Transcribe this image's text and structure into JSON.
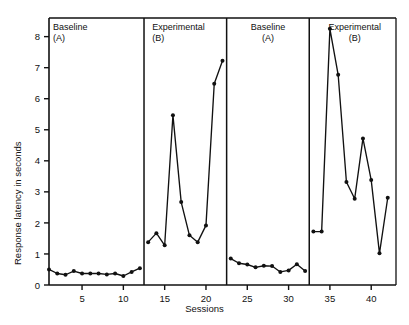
{
  "chart_data": {
    "type": "line",
    "title": "",
    "xlabel": "Sessions",
    "ylabel": "Response latency in seconds",
    "xlim": [
      1,
      43
    ],
    "ylim": [
      0,
      8.6
    ],
    "xticks": [
      5,
      10,
      15,
      20,
      25,
      30,
      35,
      40
    ],
    "yticks": [
      0,
      1,
      2,
      3,
      4,
      5,
      6,
      7,
      8
    ],
    "grid": false,
    "legend": "none",
    "phases": [
      {
        "name": "Baseline",
        "condition": "(A)",
        "x_start": 1,
        "x_end": 12,
        "align": "left"
      },
      {
        "name": "Experimental",
        "condition": "(B)",
        "x_start": 13,
        "x_end": 22,
        "align": "left"
      },
      {
        "name": "Baseline",
        "condition": "(A)",
        "x_start": 23,
        "x_end": 32,
        "align": "center"
      },
      {
        "name": "Experimental",
        "condition": "(B)",
        "x_start": 33,
        "x_end": 43,
        "align": "center"
      }
    ],
    "series": [
      {
        "name": "Response latency",
        "marker": "filled-circle",
        "segments": [
          {
            "phase": "Baseline (A)",
            "x": [
              1,
              2,
              3,
              4,
              5,
              6,
              7,
              8,
              9,
              10,
              11,
              12
            ],
            "y": [
              0.5,
              0.37,
              0.33,
              0.45,
              0.37,
              0.37,
              0.37,
              0.34,
              0.37,
              0.29,
              0.42,
              0.54
            ]
          },
          {
            "phase": "Experimental (B)",
            "x": [
              13,
              14,
              15,
              16,
              17,
              18,
              19,
              20,
              21,
              22
            ],
            "y": [
              1.38,
              1.67,
              1.28,
              5.47,
              2.67,
              1.6,
              1.38,
              1.92,
              6.48,
              7.22
            ]
          },
          {
            "phase": "Baseline (A)",
            "x": [
              23,
              24,
              25,
              26,
              27,
              28,
              29,
              30,
              31,
              32
            ],
            "y": [
              0.85,
              0.7,
              0.66,
              0.57,
              0.62,
              0.61,
              0.42,
              0.47,
              0.67,
              0.45
            ]
          },
          {
            "phase": "Experimental (B)",
            "x": [
              33,
              34,
              35,
              36,
              37,
              38,
              39,
              40,
              41,
              42
            ],
            "y": [
              1.72,
              1.72,
              8.25,
              6.77,
              3.32,
              2.78,
              4.72,
              3.38,
              1.02,
              2.81
            ]
          }
        ]
      }
    ]
  },
  "axis": {
    "y_title": "Response latency in seconds",
    "x_title": "Sessions"
  },
  "colors": {
    "line": "#111111",
    "marker": "#111111",
    "axis": "#111111",
    "background": "#ffffff"
  }
}
